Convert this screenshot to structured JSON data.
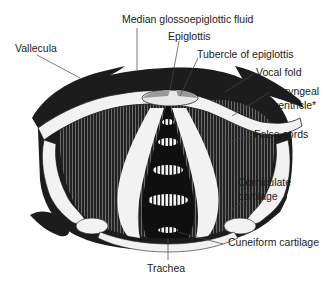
{
  "figure": {
    "colors": {
      "background": "#ffffff",
      "tissue_dark": "#1c1c1c",
      "tissue_striped": "#3a3a3a",
      "highlight": "#f2f2f2",
      "label_text": "#1a1a1a",
      "leader_line": "#444444"
    }
  },
  "labels": {
    "median_glossoepiglottic": "Median glossoepiglottic fluid",
    "epiglottis": "Epiglottis",
    "tubercle": "Tubercle of epiglottis",
    "vallecula": "Vallecula",
    "vocal_fold": "Vocal fold",
    "laryngeal_ventricle_1": "Laryngeal",
    "laryngeal_ventricle_2": "ventricle*",
    "false_cords": "False cords",
    "corniculate_1": "Corniculate",
    "corniculate_2": "cartilage",
    "cuneiform": "Cuneiform cartilage",
    "trachea": "Trachea"
  }
}
